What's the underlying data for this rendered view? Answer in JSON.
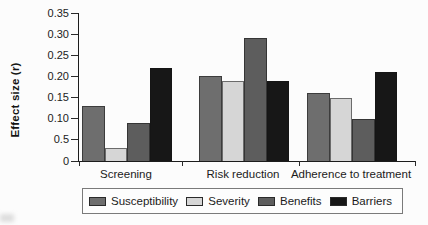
{
  "chart_data": {
    "type": "bar",
    "title": "",
    "xlabel": "",
    "ylabel": "Effect size (r)",
    "categories": [
      "Screening",
      "Risk reduction",
      "Adherence to treatment"
    ],
    "series": [
      {
        "name": "Susceptibility",
        "color": "#6e6e6e",
        "values": [
          0.13,
          0.2,
          0.16
        ]
      },
      {
        "name": "Severity",
        "color": "#d6d6d6",
        "values": [
          0.03,
          0.19,
          0.15
        ]
      },
      {
        "name": "Benefits",
        "color": "#5d5d5d",
        "values": [
          0.09,
          0.29,
          0.1
        ]
      },
      {
        "name": "Barriers",
        "color": "#171717",
        "values": [
          0.22,
          0.19,
          0.21
        ]
      }
    ],
    "ylim": [
      0,
      0.35
    ],
    "yticks": [
      {
        "value": 0.35,
        "label": "0.35"
      },
      {
        "value": 0.3,
        "label": "0.30"
      },
      {
        "value": 0.25,
        "label": "0.25"
      },
      {
        "value": 0.2,
        "label": "0.20"
      },
      {
        "value": 0.15,
        "label": "0.15"
      },
      {
        "value": 0.1,
        "label": "0.10"
      },
      {
        "value": 0.05,
        "label": "0.5"
      },
      {
        "value": 0.0,
        "label": "0"
      }
    ],
    "grid": false,
    "legend_position": "bottom"
  },
  "colors": {
    "axis": "#1c1c1c",
    "text": "#1b1b1b",
    "background": "#fcfcfc"
  }
}
